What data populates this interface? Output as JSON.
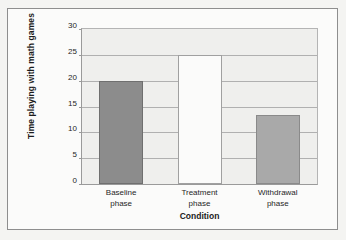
{
  "chart_data": {
    "type": "bar",
    "title": "",
    "xlabel": "Condition",
    "ylabel": "Time playing with math games",
    "categories": [
      "Baseline phase",
      "Treatment phase",
      "Withdrawal phase"
    ],
    "category_lines": [
      [
        "Baseline",
        "phase"
      ],
      [
        "Treatment",
        "phase"
      ],
      [
        "Withdrawal",
        "phase"
      ]
    ],
    "values": [
      20,
      25,
      13.3
    ],
    "ylim": [
      0,
      30
    ],
    "yticks": [
      0,
      5,
      10,
      15,
      20,
      25,
      30
    ],
    "ytick_labels": [
      "0",
      "5",
      "10",
      "15",
      "20",
      "25",
      "30"
    ],
    "grid": true,
    "legend": false,
    "bar_styles": [
      "filled-dark",
      "unfilled",
      "filled-light"
    ],
    "colors": {
      "bar_baseline": "#8c8c8c",
      "bar_treatment": "#fbfbfa",
      "bar_withdrawal": "#a9a9a9",
      "plot_background": "#efefed",
      "gridline": "#b0b0b0",
      "axis": "#9a9a9a",
      "figure_border": "#8e8e8e",
      "page_background": "#f4f4f2",
      "text": "#1c1c1c"
    }
  }
}
